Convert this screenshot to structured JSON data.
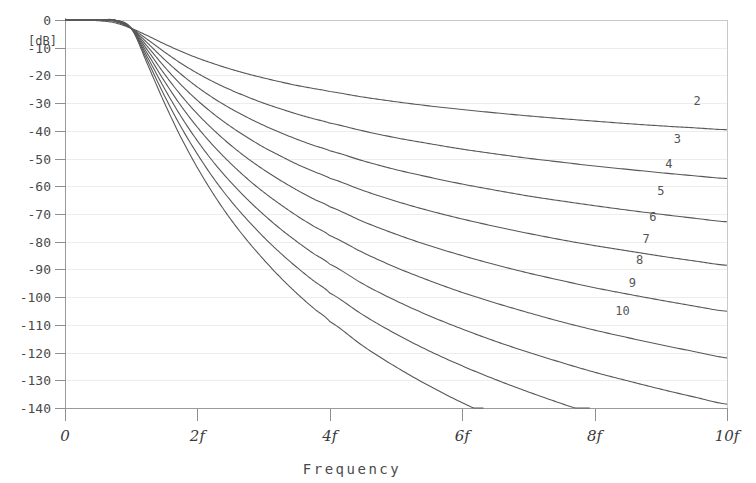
{
  "chart_data": {
    "type": "line",
    "title": "",
    "subtitle": "",
    "xlabel": "Frequency",
    "ylabel": "[dB]",
    "x_tick_labels": [
      "0",
      "2f",
      "4f",
      "6f",
      "8f",
      "10f"
    ],
    "x_tick_values": [
      0,
      2,
      4,
      6,
      8,
      10
    ],
    "xlim": [
      0,
      10
    ],
    "y_tick_labels": [
      "0",
      "-10",
      "-20",
      "-30",
      "-40",
      "-50",
      "-60",
      "-70",
      "-80",
      "-90",
      "-100",
      "-110",
      "-120",
      "-130",
      "-140"
    ],
    "y_tick_values": [
      0,
      -10,
      -20,
      -30,
      -40,
      -50,
      -60,
      -70,
      -80,
      -90,
      -100,
      -110,
      -120,
      -130,
      -140
    ],
    "ylim": [
      -140,
      0
    ],
    "grid": true,
    "legend_position": "inline-right-of-curve",
    "line_color": "#585858",
    "grid_color": "#ededed",
    "axis_color": "#9a9a9a",
    "x": [
      0,
      0.25,
      0.5,
      0.75,
      1,
      1.25,
      1.5,
      1.75,
      2,
      2.25,
      2.5,
      2.75,
      3,
      3.25,
      3.5,
      3.75,
      4,
      4.5,
      5,
      5.5,
      6,
      6.5,
      7,
      7.5,
      8,
      8.5,
      9,
      9.5,
      10
    ],
    "series": [
      {
        "name": "2",
        "label": "2",
        "label_x": 9.55,
        "label_y": -30.5,
        "values": [
          0,
          -0.07,
          -0.26,
          -1.0,
          -3.01,
          -5.7,
          -8.6,
          -11.3,
          -13.7,
          -15.8,
          -17.7,
          -19.4,
          -20.9,
          -22.3,
          -23.6,
          -24.7,
          -25.8,
          -27.8,
          -29.5,
          -31.0,
          -32.3,
          -33.5,
          -34.6,
          -35.6,
          -36.5,
          -37.4,
          -38.2,
          -38.9,
          -39.6
        ]
      },
      {
        "name": "3",
        "label": "3",
        "label_x": 9.25,
        "label_y": -44.5,
        "values": [
          0,
          -0.0,
          -0.07,
          -0.55,
          -3.01,
          -7.1,
          -11.5,
          -15.6,
          -19.2,
          -22.4,
          -25.2,
          -27.7,
          -30.0,
          -32.0,
          -33.9,
          -35.6,
          -37.2,
          -40.0,
          -42.5,
          -44.6,
          -46.6,
          -48.3,
          -49.9,
          -51.3,
          -52.7,
          -53.9,
          -55.1,
          -56.2,
          -57.2
        ]
      },
      {
        "name": "4",
        "label": "4",
        "label_x": 9.12,
        "label_y": -53.5,
        "values": [
          0,
          -0.0,
          -0.02,
          -0.3,
          -3.01,
          -8.4,
          -14.2,
          -19.5,
          -24.2,
          -28.3,
          -31.9,
          -35.1,
          -38.0,
          -40.6,
          -43.0,
          -45.2,
          -47.2,
          -50.8,
          -54.0,
          -56.7,
          -59.2,
          -61.4,
          -63.5,
          -65.3,
          -67.0,
          -68.6,
          -70.1,
          -71.5,
          -72.8
        ]
      },
      {
        "name": "5",
        "label": "5",
        "label_x": 9.0,
        "label_y": -63.0,
        "values": [
          0,
          -0.0,
          -0.0,
          -0.17,
          -3.01,
          -9.7,
          -16.8,
          -23.3,
          -29.0,
          -34.0,
          -38.4,
          -42.3,
          -45.9,
          -49.0,
          -52.0,
          -54.6,
          -57.1,
          -61.5,
          -65.4,
          -68.8,
          -71.8,
          -74.5,
          -77.0,
          -79.3,
          -81.4,
          -83.3,
          -85.2,
          -86.9,
          -88.5
        ]
      },
      {
        "name": "6",
        "label": "6",
        "label_x": 8.88,
        "label_y": -72.5,
        "values": [
          0,
          -0.0,
          -0.0,
          -0.1,
          -3.01,
          -11.0,
          -19.4,
          -27.1,
          -33.9,
          -39.8,
          -45.1,
          -49.8,
          -54.0,
          -57.8,
          -61.3,
          -64.5,
          -67.4,
          -72.7,
          -77.3,
          -81.4,
          -85.0,
          -88.3,
          -91.3,
          -94.0,
          -96.6,
          -98.9,
          -101.1,
          -103.2,
          -105.1
        ]
      },
      {
        "name": "7",
        "label": "7",
        "label_x": 8.78,
        "label_y": -80.5,
        "values": [
          0,
          -0.0,
          -0.0,
          -0.06,
          -3.01,
          -12.3,
          -22.0,
          -30.9,
          -38.7,
          -45.6,
          -51.7,
          -57.2,
          -62.1,
          -66.5,
          -70.6,
          -74.3,
          -77.8,
          -83.9,
          -89.3,
          -94.0,
          -98.3,
          -102.1,
          -105.6,
          -108.9,
          -111.9,
          -114.6,
          -117.2,
          -119.6,
          -121.9
        ]
      },
      {
        "name": "8",
        "label": "8",
        "label_x": 8.68,
        "label_y": -88.0,
        "values": [
          0,
          -0.0,
          -0.0,
          -0.04,
          -3.01,
          -13.6,
          -24.6,
          -34.7,
          -43.6,
          -51.5,
          -58.4,
          -64.6,
          -70.2,
          -75.3,
          -79.9,
          -84.2,
          -88.1,
          -95.2,
          -101.3,
          -106.7,
          -111.5,
          -115.9,
          -119.9,
          -123.6,
          -127.1,
          -130.2,
          -133.2,
          -136.0,
          -138.6
        ]
      },
      {
        "name": "9",
        "label": "9",
        "label_x": 8.57,
        "label_y": -96.5,
        "values": [
          0,
          -0.0,
          -0.0,
          -0.02,
          -3.01,
          -14.9,
          -27.2,
          -38.5,
          -48.4,
          -57.3,
          -65.1,
          -72.0,
          -78.3,
          -84.0,
          -89.2,
          -94.0,
          -98.5,
          -106.4,
          -113.3,
          -119.4,
          -124.8,
          -129.7,
          -134.2,
          -138.4,
          -142.3,
          -145.9,
          -149.2,
          -152.4,
          -155.3
        ]
      },
      {
        "name": "10",
        "label": "10",
        "label_x": 8.42,
        "label_y": -106.5,
        "values": [
          0,
          -0.0,
          -0.0,
          -0.01,
          -3.01,
          -16.2,
          -29.8,
          -42.3,
          -53.3,
          -63.1,
          -71.8,
          -79.5,
          -86.4,
          -92.8,
          -98.6,
          -103.9,
          -108.8,
          -117.6,
          -125.2,
          -132.0,
          -138.1,
          -143.5,
          -148.5,
          -153.2,
          -157.5,
          -161.5,
          -165.3,
          -168.8,
          -172.1
        ]
      }
    ]
  },
  "render_hints": {
    "plot_left_px": 65,
    "plot_right_px": 727,
    "plot_top_px": 20,
    "plot_bottom_px": 408,
    "endpoint_db_at_10f": [
      -34,
      -48,
      -57,
      -67,
      -77,
      -87,
      -97,
      -108,
      -119
    ]
  }
}
